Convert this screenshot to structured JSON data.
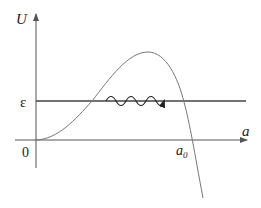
{
  "diagram": {
    "axes": {
      "y_label": "U",
      "x_label": "a",
      "origin_label": "0"
    },
    "labels": {
      "energy_level": "ε",
      "root": "a",
      "root_subscript": "0"
    },
    "elements": [
      {
        "type": "curve",
        "description": "Potential U(a): rises from origin, peaks above ε, crosses axis at a0, then falls below"
      },
      {
        "type": "horizontal-line",
        "description": "Energy level ε"
      },
      {
        "type": "wavy-arrow",
        "description": "Tunneling through barrier along ε level"
      }
    ],
    "colors": {
      "axes": "#555555",
      "curve": "#777777",
      "energy_line": "#444444",
      "text": "#222222"
    }
  }
}
